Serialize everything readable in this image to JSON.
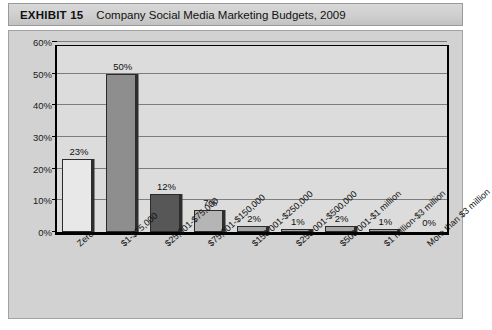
{
  "exhibit": {
    "label": "EXHIBIT 15",
    "title": "Company Social Media Marketing Budgets, 2009"
  },
  "chart_data": {
    "type": "bar",
    "title": "Company Social Media Marketing Budgets, 2009",
    "xlabel": "",
    "ylabel": "",
    "ylim": [
      0,
      60
    ],
    "yticks": [
      "0%",
      "10%",
      "20%",
      "30%",
      "40%",
      "50%",
      "60%"
    ],
    "ytick_values": [
      0,
      10,
      20,
      30,
      40,
      50,
      60
    ],
    "grid": "horizontal",
    "legend": "none",
    "categories": [
      "Zero",
      "$1-$25,000",
      "$25,001-$75,000",
      "$75,001-$150,000",
      "$150,001-$250,000",
      "$250,001-$500,000",
      "$500,001-$1 million",
      "$1 million-$3 million",
      "More than $3 million"
    ],
    "values": [
      23,
      50,
      12,
      7,
      2,
      1,
      2,
      1,
      0
    ],
    "value_labels": [
      "23%",
      "50%",
      "12%",
      "7%",
      "2%",
      "1%",
      "2%",
      "1%",
      "0%"
    ],
    "bar_colors": [
      "#e8e8e8",
      "#8e8e8e",
      "#575757",
      "#b5b5b5",
      "#a5a5a5",
      "#a5a5a5",
      "#a5a5a5",
      "#a5a5a5",
      "#a5a5a5"
    ]
  },
  "colors": {
    "header_band": "#cfcfcf",
    "chart_background": "#d2d2d2",
    "plot_background": "#dcdcdc",
    "axis": "#000000",
    "gridline": "#7d7d7d"
  }
}
